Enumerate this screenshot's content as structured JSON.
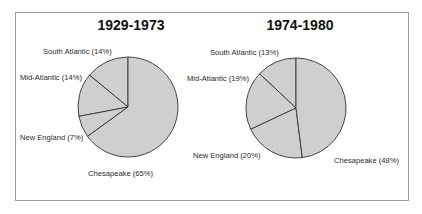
{
  "chart_data": [
    {
      "type": "pie",
      "title": "1929-1973",
      "categories": [
        "South Atlantic",
        "Mid-Atlantic",
        "New England",
        "Chesapeake"
      ],
      "values": [
        14,
        14,
        7,
        65
      ],
      "unit": "%",
      "labels": [
        "South Atlantic (14%)",
        "Mid-Atlantic (14%)",
        "New England (7%)",
        "Chesapeake (65%)"
      ],
      "start_angle": "12 o'clock",
      "direction": "counter-clockwise",
      "fill_color": "#cfcfcf",
      "legend": "none (direct labels)"
    },
    {
      "type": "pie",
      "title": "1974-1980",
      "categories": [
        "South Atlantic",
        "Mid-Atlantic",
        "New England",
        "Chesapeake"
      ],
      "values": [
        13,
        19,
        20,
        48
      ],
      "unit": "%",
      "labels": [
        "South Atlantic (13%)",
        "Mid-Atlantic (19%)",
        "New England (20%)",
        "Chesapeake (48%)"
      ],
      "start_angle": "12 o'clock",
      "direction": "counter-clockwise",
      "fill_color": "#cfcfcf",
      "legend": "none (direct labels)"
    }
  ],
  "colors": {
    "slice_fill": "#cfcfcf",
    "slice_stroke": "#333333",
    "text": "#2a2a2a",
    "frame": "#9a9a9a"
  }
}
